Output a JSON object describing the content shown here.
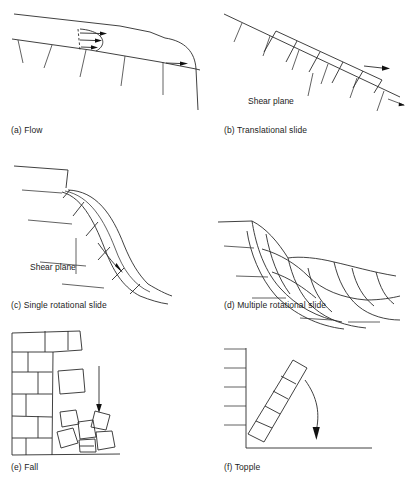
{
  "figure": {
    "panel_count": 6,
    "line_color": "#2b2b2b",
    "background": "#ffffff",
    "text_color": "#1c1c1c"
  },
  "panels": [
    {
      "id": "a",
      "caption": "(a) Flow",
      "inline_labels": [],
      "mechanism": "flow",
      "features": [
        "slope surface line",
        "hatch ticks along slope",
        "dashed vertical velocity profile",
        "three horizontal velocity arrows",
        "curved failure toe",
        "runout arrow at toe"
      ]
    },
    {
      "id": "b",
      "caption": "(b) Translational slide",
      "inline_labels": [
        "Shear plane"
      ],
      "mechanism": "translational-slide",
      "features": [
        "inclined slope line",
        "hatch ticks below slope",
        "row of rectangular blocks sliding on planar surface",
        "leader line to shear plane label",
        "displacement arrow downslope"
      ]
    },
    {
      "id": "c",
      "caption": "(c) Single rotational slide",
      "inline_labels": [
        "Shear plane"
      ],
      "mechanism": "single-rotational-slide",
      "features": [
        "curved concave failure arc",
        "blocks between arcs",
        "hatch ticks",
        "leader line to shear plane label",
        "curved rotation arrow"
      ]
    },
    {
      "id": "d",
      "caption": "(d) Multiple rotational slide",
      "inline_labels": [],
      "mechanism": "multiple-rotational-slide",
      "features": [
        "multiple nested curved failure arcs",
        "grid of deformed blocks",
        "hatch ticks along ground surface"
      ]
    },
    {
      "id": "e",
      "caption": "(e) Fall",
      "inline_labels": [],
      "mechanism": "fall",
      "features": [
        "vertical jointed rock face",
        "brick-like block pattern",
        "detached free-falling block",
        "downward fall arrow",
        "talus pile of angular blocks at base",
        "ground line"
      ]
    },
    {
      "id": "f",
      "caption": "(f) Topple",
      "inline_labels": [],
      "mechanism": "topple",
      "features": [
        "vertical cliff face with hatch ticks",
        "inclined column of stacked blocks",
        "curved toppling arrow",
        "ground line"
      ]
    }
  ]
}
